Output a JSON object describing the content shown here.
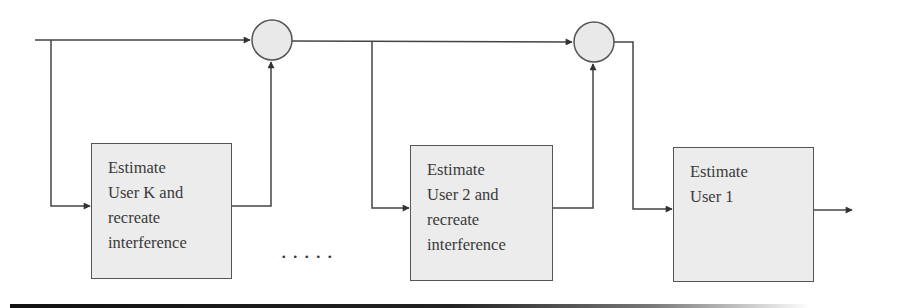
{
  "diagram": {
    "type": "successive-interference-cancellation-block-diagram",
    "colors": {
      "line": "#444444",
      "box_fill": "#ececec",
      "box_border": "#555555",
      "summer_fill": "#e9e9e9",
      "text": "#3a3a3a"
    },
    "blocks": [
      {
        "id": "block-user-k",
        "lines": [
          "Estimate",
          "User K and",
          "recreate",
          "interference"
        ]
      },
      {
        "id": "block-user-2",
        "lines": [
          "Estimate",
          "User 2 and",
          "recreate",
          "interference"
        ]
      },
      {
        "id": "block-user-1",
        "lines": [
          "Estimate",
          "User 1"
        ]
      }
    ],
    "summers": [
      {
        "id": "summer-1"
      },
      {
        "id": "summer-2"
      }
    ],
    "ellipsis": "....."
  }
}
